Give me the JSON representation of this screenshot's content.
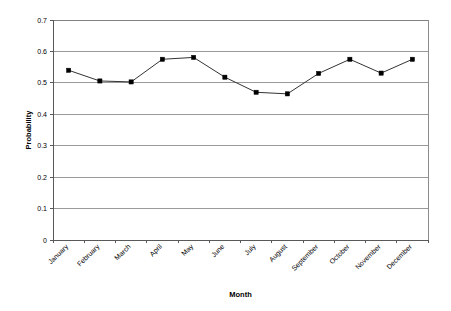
{
  "chart_data": {
    "type": "line",
    "title": "",
    "xlabel": "Month",
    "ylabel": "Probability",
    "categories": [
      "January",
      "February",
      "March",
      "April",
      "May",
      "June",
      "July",
      "August",
      "September",
      "October",
      "November",
      "December"
    ],
    "values": [
      0.54,
      0.506,
      0.503,
      0.575,
      0.581,
      0.518,
      0.47,
      0.465,
      0.53,
      0.575,
      0.531,
      0.575
    ],
    "series": [
      {
        "name": "Probability",
        "values": [
          0.54,
          0.506,
          0.503,
          0.575,
          0.581,
          0.518,
          0.47,
          0.465,
          0.53,
          0.575,
          0.531,
          0.575
        ]
      }
    ],
    "ylim": [
      0,
      0.7
    ],
    "ytick_labels": [
      "0",
      "0.1",
      "0.2",
      "0.3",
      "0.4",
      "0.5",
      "0.6",
      "0.7"
    ],
    "ytick_values": [
      0,
      0.1,
      0.2,
      0.3,
      0.4,
      0.5,
      0.6,
      0.7
    ],
    "grid": true,
    "grid_axis": "y",
    "legend": false,
    "legend_position": "none",
    "marker": "square",
    "line_color": "#333333",
    "marker_color": "#000000",
    "grid_color": "#808080",
    "background_color": "#FFFFFF",
    "category_label_rotation": -45
  }
}
